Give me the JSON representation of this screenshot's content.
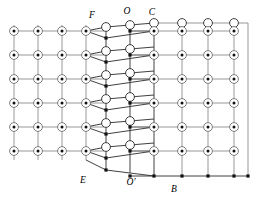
{
  "figure": {
    "width": 262,
    "height": 197,
    "background_color": "#ffffff"
  },
  "style": {
    "edge_color": "#8c8c8c",
    "edge_color_dark": "#2a2a2a",
    "ring_color": "#6e6e6e",
    "pip_color": "#111111",
    "open_ring_color": "#2a2a2a",
    "square_color": "#111111",
    "label_color": "#000000",
    "dotted_node_radius": 4.4,
    "dotted_node_pip_radius": 1.5,
    "open_node_radius": 4.4,
    "square_node_size": 3.2
  },
  "labels": [
    {
      "id": "label-F",
      "text": "F",
      "x": 92,
      "y": 18,
      "anchor": "middle"
    },
    {
      "id": "label-O",
      "text": "O",
      "x": 127,
      "y": 14,
      "anchor": "middle"
    },
    {
      "id": "label-C",
      "text": "C",
      "x": 152,
      "y": 15,
      "anchor": "middle"
    },
    {
      "id": "label-E",
      "text": "E",
      "x": 83,
      "y": 183,
      "anchor": "middle"
    },
    {
      "id": "label-Oprime",
      "text": "O′",
      "x": 131,
      "y": 185,
      "anchor": "middle"
    },
    {
      "id": "label-B",
      "text": "B",
      "x": 174,
      "y": 192,
      "anchor": "middle"
    }
  ],
  "regions": {
    "left_lattice": {
      "name": "left-rectangular-lattice",
      "node_type": "dotted-circle",
      "columns_x": [
        14,
        38,
        62,
        86
      ],
      "rows_y": [
        31,
        55,
        79,
        103,
        127,
        151
      ]
    },
    "transition_lattice": {
      "name": "middle-skewed-lattice",
      "node_type": "mixed-open-circle-and-square",
      "description": "Sheared band between left and right lattices where open circles and small filled squares alternate"
    },
    "right_lattice": {
      "name": "right-rectangular-lattice",
      "node_type": "dotted-circle-with-open-top-row",
      "columns_x": [
        154,
        182,
        208,
        234
      ],
      "rows_y": [
        31,
        55,
        79,
        103,
        127,
        151
      ],
      "bottom_row_y": 176,
      "bottom_row_node_type": "small-filled-square"
    }
  },
  "counts": {
    "left_columns": 4,
    "left_rows": 6,
    "right_columns": 4,
    "right_rows": 6,
    "transition_columns": 3
  }
}
